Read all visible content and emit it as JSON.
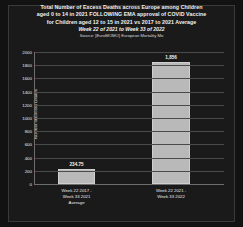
{
  "chart_data": {
    "type": "bar",
    "title_lines": [
      "Total Number of Excess Deaths across Europe among Children",
      "aged 0 to 14 in 2021 FOLLOWING EMA approval of COVID Vaccine",
      "for Children aged 12 to 15 in 2021 vs 2017 to 2021 Average"
    ],
    "subtitle": "Week 22 of 2021 to Week 33 of 2022",
    "source": "Source: [EuroMOMO] European Mortality Mo",
    "categories": [
      "Week 22 2017 - Week 33 2021 Average",
      "Week 22 2021 - Week 33 2022"
    ],
    "category_lines": [
      [
        "Week 22 2017 -",
        "Week 33 2021",
        "Average"
      ],
      [
        "Week 22 2021 -",
        "Week 33 2022"
      ]
    ],
    "values": [
      234.75,
      1856
    ],
    "value_labels": [
      "234.75",
      "1,856"
    ],
    "xlabel": "",
    "ylabel": "Number of Excess Deaths",
    "ylim": [
      0,
      2000
    ],
    "ytick_labels": [
      "2000",
      "1800",
      "1600",
      "1400",
      "1200",
      "1000",
      "800",
      "600",
      "400",
      "200",
      "0"
    ],
    "ytick_values": [
      2000,
      1800,
      1600,
      1400,
      1200,
      1000,
      800,
      600,
      400,
      200,
      0
    ],
    "grid": true,
    "legend": null,
    "colors": {
      "background": "#121212",
      "bar": "#b9b9b9",
      "text": "#f2f2f2",
      "gridline": "#4a4a4a",
      "axis": "#6e6e6e"
    }
  }
}
